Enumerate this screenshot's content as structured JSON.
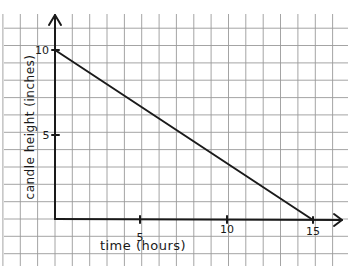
{
  "chart_data": {
    "type": "line",
    "title": "",
    "xlabel": "time (hours)",
    "ylabel": "candle height (inches)",
    "x_ticks": [
      5,
      10,
      15
    ],
    "y_ticks": [
      5,
      10
    ],
    "xlim": [
      0,
      16.5
    ],
    "ylim": [
      0,
      11.5
    ],
    "grid": true,
    "legend": null,
    "series": [
      {
        "name": "candle height",
        "x": [
          0,
          15
        ],
        "y": [
          10,
          0
        ]
      }
    ]
  },
  "labels": {
    "x_tick_5": "5",
    "x_tick_10": "10",
    "x_tick_15": "15",
    "y_tick_5": "5",
    "y_tick_10": "10",
    "xlabel": "time (hours)",
    "ylabel": "candle height (inches)"
  },
  "colors": {
    "grid": "#9a9a9a",
    "ink": "#1a1a1a",
    "paper": "#ffffff"
  }
}
